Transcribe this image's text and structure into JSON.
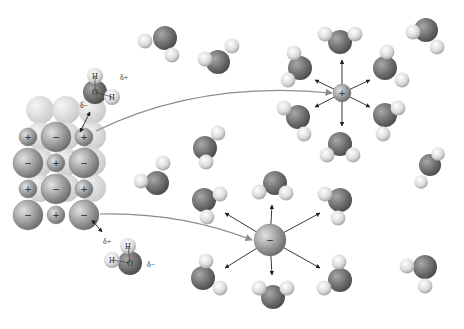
{
  "diagram": {
    "colors": {
      "oxygen": "#6e6e6e",
      "hydrogen": "#e6e6e6",
      "anion": "#9a9a9a",
      "cation": "#8a8a8a",
      "crystal_back": "#d8d8d8",
      "arrow": "#8c8c8c",
      "dipole_arrow": "#222222"
    },
    "labels": {
      "delta_plus": "δ+",
      "delta_minus": "δ−",
      "oxygen": "O",
      "hydrogen": "H",
      "plus": "+",
      "minus": "−"
    },
    "crystal": {
      "rows": [
        [
          "+",
          "−",
          "+"
        ],
        [
          "−",
          "+",
          "−"
        ],
        [
          "+",
          "−",
          "+"
        ],
        [
          "−",
          "+",
          "−"
        ]
      ]
    },
    "labeled_waters": [
      {
        "name": "water-top",
        "ox": 95,
        "oy": 92,
        "h1x": 95,
        "h1y": 76,
        "h2x": 112,
        "h2y": 97,
        "delta_plus": {
          "x": 120,
          "y": 80
        },
        "delta_minus": {
          "x": 80,
          "y": 108
        }
      },
      {
        "name": "water-bottom",
        "ox": 130,
        "oy": 263,
        "h1x": 128,
        "h1y": 246,
        "h2x": 112,
        "h2y": 260,
        "delta_plus": {
          "x": 103,
          "y": 244
        },
        "delta_minus": {
          "x": 147,
          "y": 267
        }
      }
    ],
    "cation_hydrated": {
      "x": 342,
      "y": 93,
      "r": 9,
      "sign": "+"
    },
    "anion_hydrated": {
      "x": 270,
      "y": 240,
      "r": 16,
      "sign": "−"
    },
    "free_waters": [
      {
        "x": 165,
        "y": 38,
        "r": 12,
        "h": [
          [
            145,
            41
          ],
          [
            172,
            55
          ]
        ]
      },
      {
        "x": 218,
        "y": 62,
        "r": 12,
        "h": [
          [
            205,
            59
          ],
          [
            232,
            46
          ]
        ]
      },
      {
        "x": 205,
        "y": 148,
        "r": 12,
        "h": [
          [
            218,
            133
          ],
          [
            206,
            162
          ]
        ]
      },
      {
        "x": 157,
        "y": 183,
        "r": 12,
        "h": [
          [
            141,
            181
          ],
          [
            163,
            163
          ]
        ]
      },
      {
        "x": 426,
        "y": 30,
        "r": 12,
        "h": [
          [
            413,
            32
          ],
          [
            437,
            47
          ]
        ]
      },
      {
        "x": 430,
        "y": 165,
        "r": 11,
        "h": [
          [
            438,
            154
          ],
          [
            421,
            182
          ]
        ]
      },
      {
        "x": 425,
        "y": 267,
        "r": 12,
        "h": [
          [
            407,
            266
          ],
          [
            425,
            286
          ]
        ]
      }
    ],
    "cation_shell": [
      {
        "x": 340,
        "y": 42,
        "r": 12,
        "h": [
          [
            325,
            34
          ],
          [
            355,
            34
          ]
        ],
        "ax": 342,
        "ay": 60
      },
      {
        "x": 300,
        "y": 68,
        "r": 12,
        "h": [
          [
            294,
            53
          ],
          [
            288,
            80
          ]
        ],
        "ax": 315,
        "ay": 80
      },
      {
        "x": 385,
        "y": 68,
        "r": 12,
        "h": [
          [
            387,
            52
          ],
          [
            402,
            80
          ]
        ],
        "ax": 370,
        "ay": 80
      },
      {
        "x": 298,
        "y": 117,
        "r": 12,
        "h": [
          [
            284,
            108
          ],
          [
            304,
            134
          ]
        ],
        "ax": 315,
        "ay": 107
      },
      {
        "x": 385,
        "y": 115,
        "r": 12,
        "h": [
          [
            398,
            108
          ],
          [
            383,
            134
          ]
        ],
        "ax": 370,
        "ay": 107
      },
      {
        "x": 340,
        "y": 144,
        "r": 12,
        "h": [
          [
            327,
            155
          ],
          [
            353,
            155
          ]
        ],
        "ax": 342,
        "ay": 126
      }
    ],
    "anion_shell": [
      {
        "x": 275,
        "y": 183,
        "r": 12,
        "h": [
          [
            259,
            192
          ],
          [
            286,
            193
          ]
        ],
        "ax": 272,
        "ay": 205
      },
      {
        "x": 204,
        "y": 200,
        "r": 12,
        "h": [
          [
            220,
            194
          ],
          [
            207,
            217
          ]
        ],
        "ax": 225,
        "ay": 213
      },
      {
        "x": 340,
        "y": 200,
        "r": 12,
        "h": [
          [
            325,
            194
          ],
          [
            338,
            218
          ]
        ],
        "ax": 320,
        "ay": 213
      },
      {
        "x": 203,
        "y": 278,
        "r": 12,
        "h": [
          [
            206,
            261
          ],
          [
            220,
            288
          ]
        ],
        "ax": 225,
        "ay": 268
      },
      {
        "x": 340,
        "y": 280,
        "r": 12,
        "h": [
          [
            339,
            262
          ],
          [
            324,
            288
          ]
        ],
        "ax": 320,
        "ay": 268
      },
      {
        "x": 273,
        "y": 297,
        "r": 12,
        "h": [
          [
            259,
            288
          ],
          [
            287,
            288
          ]
        ],
        "ax": 272,
        "ay": 275
      }
    ],
    "transfer_arrows": [
      {
        "name": "cation-transfer-arrow",
        "d": "M 96 131 Q 200 80 332 93"
      },
      {
        "name": "anion-transfer-arrow",
        "d": "M 100 214 Q 180 212 252 240"
      }
    ]
  }
}
